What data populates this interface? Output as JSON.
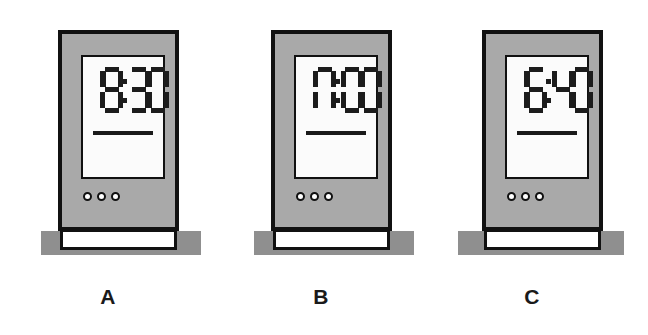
{
  "background_color": "#ffffff",
  "palette": {
    "body_grey": "#a9a9a9",
    "ground_grey": "#8f8f8f",
    "outline_black": "#111111",
    "screen_white": "#fbfbfb",
    "segment_black": "#1c1c1c"
  },
  "clocks": [
    {
      "label": "A",
      "time": "19:30",
      "hours": "19",
      "minutes": "30",
      "digits": [
        "1",
        "9",
        "3",
        "0"
      ],
      "separator": ":",
      "button_count": 3
    },
    {
      "label": "B",
      "time": "17:00",
      "hours": "17",
      "minutes": "00",
      "digits": [
        "1",
        "7",
        "0",
        "0"
      ],
      "separator": ":",
      "button_count": 3
    },
    {
      "label": "C",
      "time": "16:40",
      "hours": "16",
      "minutes": "40",
      "digits": [
        "1",
        "6",
        "4",
        "0"
      ],
      "separator": ":",
      "button_count": 3
    }
  ]
}
